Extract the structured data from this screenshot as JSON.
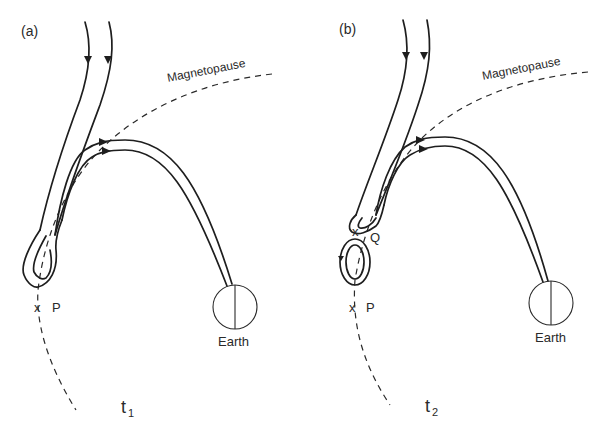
{
  "figure": {
    "panels": [
      {
        "id": "a",
        "label": "(a)",
        "time_label": "t",
        "time_sub": "1",
        "magnetopause_label": "Magnetopause",
        "earth_label": "Earth",
        "x_points": [
          {
            "label": "P"
          }
        ]
      },
      {
        "id": "b",
        "label": "(b)",
        "time_label": "t",
        "time_sub": "2",
        "magnetopause_label": "Magnetopause",
        "earth_label": "Earth",
        "x_points": [
          {
            "label": "Q"
          },
          {
            "label": "P"
          }
        ]
      }
    ],
    "x_marker": "x"
  }
}
